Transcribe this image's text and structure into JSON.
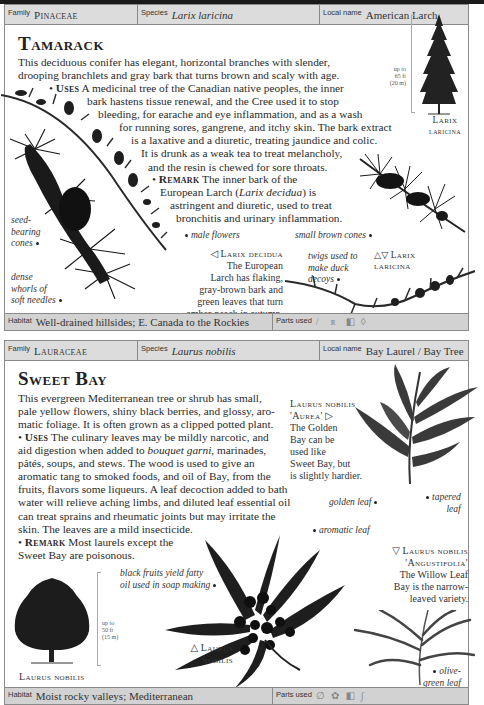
{
  "entries": [
    {
      "header": {
        "family_label": "Family",
        "family": "Pinaceae",
        "species_label": "Species",
        "species": "Larix laricina",
        "local_label": "Local name",
        "local": "American Larch"
      },
      "title": "Tamarack",
      "description": [
        "This deciduous conifer has elegant, horizontal branches with slender,",
        "drooping branchlets and gray bark that turns brown and scaly with age."
      ],
      "uses_label": "Uses",
      "uses": [
        "A medicinal tree of the Canadian native peoples, the inner",
        "bark hastens tissue renewal, and the Cree used it to stop",
        "bleeding, for earache and eye inflammation, and as a wash",
        "for running sores, gangrene, and itchy skin. The bark extract",
        "is a laxative and a diuretic, treating jaundice and colic.",
        "It is drunk as a weak tea to treat melancholy,",
        "and the resin is chewed for sore throats."
      ],
      "remark_label": "Remark",
      "remark": [
        "The inner bark of the",
        "European Larch (",
        "Larix decidua",
        ") is",
        "astringent and diuretic, used to treat",
        "bronchitis and urinary inflammation."
      ],
      "tree": {
        "height_note": [
          "up to",
          "65 ft",
          "(20 m)"
        ],
        "caption": [
          "Larix",
          "laricina"
        ]
      },
      "annotations": {
        "seed_cones": [
          "seed-",
          "bearing",
          "cones"
        ],
        "needles": [
          "dense",
          "whorls of",
          "soft needles"
        ],
        "male_flowers": "male flowers",
        "brown_cones": "small brown cones",
        "twigs": [
          "twigs used to",
          "make duck",
          "decoys"
        ]
      },
      "decidua_caption": {
        "symbol": "◁",
        "name": "Larix decidua",
        "text": [
          "The European",
          "Larch has flaking,",
          "gray-brown bark and",
          "green leaves that turn",
          "amber-peach in autumn."
        ]
      },
      "laricina_caption": {
        "symbol": "△▽",
        "name": [
          "Larix",
          "laricina"
        ]
      },
      "footer": {
        "habitat_label": "Habitat",
        "habitat": "Well-drained hillsides; E. Canada to the Rockies",
        "parts_label": "Parts used",
        "parts_icons": [
          "bark-icon",
          "resin-icon",
          "leaf-icon",
          "oil-drop-icon"
        ]
      }
    },
    {
      "header": {
        "family_label": "Family",
        "family": "Lauraceae",
        "species_label": "Species",
        "species": "Laurus nobilis",
        "local_label": "Local name",
        "local": "Bay Laurel / Bay Tree"
      },
      "title": "Sweet Bay",
      "description": [
        "This evergreen Mediterranean tree or shrub has small,",
        "pale yellow flowers, shiny black berries, and glossy, aro-",
        "matic foliage. It is often grown as a clipped potted plant."
      ],
      "uses_label": "Uses",
      "uses_first": "The culinary leaves may be mildly narcotic, and",
      "uses_second_pre": "aid digestion when added to ",
      "uses_second_it": "bouquet garni",
      "uses_second_post": ", marinades,",
      "uses": [
        "pâtés, soups, and stews. The wood is used to give an",
        "aromatic tang to smoked foods, and oil of Bay, from the",
        "fruits, flavors some liqueurs. A leaf decoction added to bath",
        "water will relieve aching limbs, and diluted leaf essential oil",
        "can treat sprains and rheumatic joints but may irritate the",
        "skin. The leaves are a mild insecticide."
      ],
      "remark_label": "Remark",
      "remark": [
        "Most laurels except the",
        "Sweet Bay are poisonous."
      ],
      "tree": {
        "height_note": [
          "up to",
          "50 ft",
          "(15 m)"
        ],
        "caption": "Laurus nobilis"
      },
      "aurea_caption": {
        "name": [
          "Laurus nobilis",
          "'Aurea'"
        ],
        "symbol": "▷",
        "text": [
          "The Golden",
          "Bay can be",
          "used like",
          "Sweet Bay, but",
          "is slightly hardier."
        ]
      },
      "angustifolia_caption": {
        "symbol": "▽",
        "name": [
          "Laurus nobilis",
          "'Angustifolia'"
        ],
        "text": [
          "The Willow Leaf",
          "Bay is the narrow-",
          "leaved variety."
        ]
      },
      "main_caption": {
        "symbol": "△",
        "name": [
          "Laurus",
          "nobilis"
        ]
      },
      "annotations": {
        "golden_leaf": "golden leaf",
        "tapered_leaf": [
          "tapered",
          "leaf"
        ],
        "aromatic_leaf": "aromatic leaf",
        "black_fruits": [
          "black fruits yield fatty",
          "oil used in soap making"
        ],
        "olive_leaf": [
          "olive-",
          "green leaf"
        ]
      },
      "footer": {
        "habitat_label": "Habitat",
        "habitat": "Moist rocky valleys; Mediterranean",
        "parts_label": "Parts used",
        "parts_icons": [
          "leaf-icon",
          "flower-icon",
          "wood-icon",
          "oil-icon"
        ]
      }
    }
  ],
  "colors": {
    "header_bg": "#dcdcdc",
    "footer_bg": "#d2d2d2",
    "border": "#8a8a8a",
    "text": "#2a2a2a",
    "top_bar": "#1a1a1a"
  }
}
